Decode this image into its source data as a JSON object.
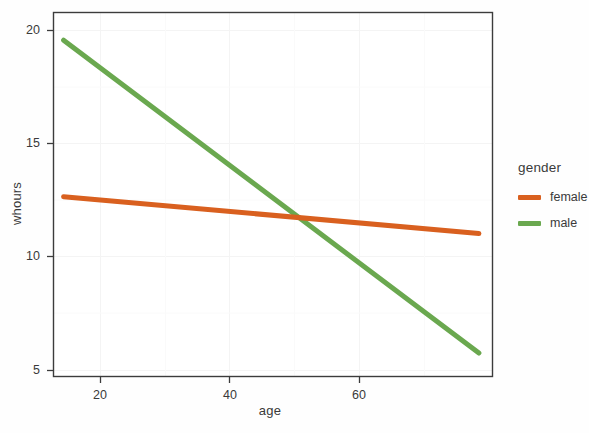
{
  "chart_data": {
    "type": "line",
    "title": "",
    "xlabel": "age",
    "ylabel": "whours",
    "xlim": [
      14.5,
      77
    ],
    "ylim": [
      4.2,
      21.0
    ],
    "xticks": [
      20,
      40,
      60
    ],
    "xtick_labels": [
      "20",
      "40",
      "60"
    ],
    "yticks": [
      5,
      10,
      15,
      20
    ],
    "ytick_labels": [
      "5",
      "10",
      "15",
      "20"
    ],
    "grid": true,
    "legend_position": "right",
    "legend_title": "gender",
    "series": [
      {
        "name": "female",
        "color": "#D9601F",
        "x": [
          16,
          75
        ],
        "y": [
          12.5,
          10.8
        ]
      },
      {
        "name": "male",
        "color": "#6AA84F",
        "x": [
          16,
          75
        ],
        "y": [
          19.7,
          5.3
        ]
      }
    ]
  },
  "axes": {
    "x_title": "age",
    "y_title": "whours",
    "x_ticks": [
      "20",
      "40",
      "60"
    ],
    "y_ticks": [
      "20",
      "15",
      "10",
      "5"
    ]
  },
  "legend": {
    "title": "gender",
    "entries": [
      {
        "label": "female",
        "color": "#D9601F"
      },
      {
        "label": "male",
        "color": "#6AA84F"
      }
    ]
  },
  "colors": {
    "female": "#D9601F",
    "male": "#6AA84F",
    "frame": "#3c3c3c",
    "grid": "#f2f2f2",
    "text": "#3a3a3a",
    "background": "#fefefe"
  }
}
